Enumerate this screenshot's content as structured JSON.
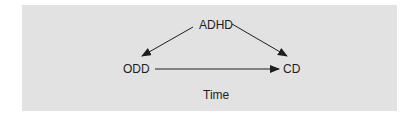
{
  "diagram": {
    "nodes": [
      {
        "id": "adhd",
        "label": "ADHD"
      },
      {
        "id": "odd",
        "label": "ODD"
      },
      {
        "id": "cd",
        "label": "CD"
      }
    ],
    "edges": [
      {
        "from": "ADHD",
        "to": "ODD"
      },
      {
        "from": "ADHD",
        "to": "CD"
      },
      {
        "from": "ODD",
        "to": "CD"
      }
    ],
    "axis_label": "Time",
    "colors": {
      "background": "#e2e2e2",
      "ink": "#1e1e1e"
    }
  }
}
